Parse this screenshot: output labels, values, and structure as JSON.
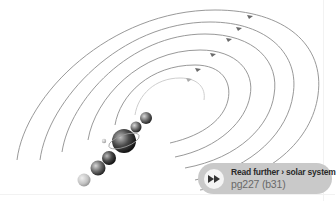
{
  "figure": {
    "orbit_count": 6,
    "planet_count": 8
  },
  "callout": {
    "icon": "fast-forward-icon",
    "title": "Read further › solar system",
    "reference": "pg227 (b31)",
    "background": "#c9c9c9"
  }
}
